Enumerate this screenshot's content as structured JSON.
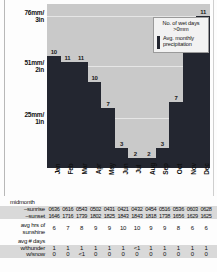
{
  "chart_data": {
    "type": "bar",
    "title": "",
    "xlabel": "",
    "ylabel": "",
    "categories": [
      "Jan",
      "Feb",
      "Mar",
      "Apr",
      "May",
      "Jun",
      "Jul",
      "Aug",
      "Sep",
      "Oct",
      "Nov",
      "Dec"
    ],
    "series": [
      {
        "name": "Avg. monthly precipitation",
        "unit": "mm",
        "values": [
          56,
          53,
          53,
          43,
          30,
          10,
          5,
          5,
          10,
          33,
          64,
          76
        ]
      },
      {
        "name": "No. of wet days >0mm",
        "unit": "days",
        "values": [
          10,
          11,
          11,
          10,
          7,
          3,
          2,
          2,
          3,
          7,
          10,
          11
        ]
      }
    ],
    "ytick_labels": [
      "76mm/3in",
      "51mm/2in",
      "25mm/1in"
    ],
    "ytick_values": [
      76,
      51,
      25
    ],
    "ylim": [
      0,
      82
    ],
    "grid": true,
    "legend_position": "inside-top-right"
  },
  "yaxis": {
    "ticks": [
      {
        "line1": "76mm/",
        "line2": "3in"
      },
      {
        "line1": "51mm/",
        "line2": "2in"
      },
      {
        "line1": "25mm/",
        "line2": "1in"
      }
    ]
  },
  "legend": {
    "title_line1": "No. of wet days",
    "title_line2": ">0mm",
    "series_line1": "Avg. monthly",
    "series_line2": "precipitation",
    "swatch_color": "#232630"
  },
  "bars": [
    {
      "month": "Jan",
      "wet_days": "10"
    },
    {
      "month": "Feb",
      "wet_days": "11"
    },
    {
      "month": "Mar",
      "wet_days": "11"
    },
    {
      "month": "Apr",
      "wet_days": "10"
    },
    {
      "month": "May",
      "wet_days": "7"
    },
    {
      "month": "Jun",
      "wet_days": "3"
    },
    {
      "month": "Jul",
      "wet_days": "2"
    },
    {
      "month": "Aug",
      "wet_days": "2"
    },
    {
      "month": "Sep",
      "wet_days": "3"
    },
    {
      "month": "Oct",
      "wet_days": "7"
    },
    {
      "month": "Nov",
      "wet_days": "10"
    },
    {
      "month": "Dec",
      "wet_days": "11"
    }
  ],
  "table": {
    "midmonth_heading": "midmonth",
    "sunrise_label": "sunrise",
    "sunset_label": "sunset",
    "sunrise": [
      "0636",
      "0616",
      "0543",
      "0502",
      "0431",
      "0421",
      "0432",
      "0454",
      "0516",
      "0536",
      "0603",
      "0628"
    ],
    "sunset": [
      "1646",
      "1716",
      "1739",
      "1802",
      "1825",
      "1843",
      "1843",
      "1818",
      "1738",
      "1656",
      "1629",
      "1625"
    ],
    "sunshine_label_line1": "avg hrs of",
    "sunshine_label_line2": "sunshine",
    "sunshine": [
      "6",
      "7",
      "8",
      "9",
      "9",
      "10",
      "10",
      "9",
      "9",
      "8",
      "6",
      "6"
    ],
    "days_heading_line1": "avg # days",
    "thunder_label": "w/thunder",
    "snow_label": "w/snow",
    "thunder": [
      "1",
      "1",
      "1",
      "1",
      "1",
      "1",
      "<1",
      "1",
      "1",
      "1",
      "1",
      "1"
    ],
    "snow": [
      "0",
      "0",
      "<1",
      "0",
      "0",
      "0",
      "0",
      "0",
      "0",
      "0",
      "0",
      "0"
    ]
  }
}
